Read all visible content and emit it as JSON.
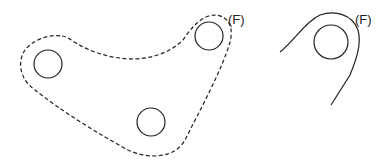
{
  "figures": [
    {
      "name": "dashed-outline-part",
      "label": "(F)",
      "holes": 3
    },
    {
      "name": "solid-edge-detail",
      "label": "(F)",
      "holes": 1
    }
  ],
  "colors": {
    "stroke": "#222222",
    "background": "#ffffff"
  }
}
